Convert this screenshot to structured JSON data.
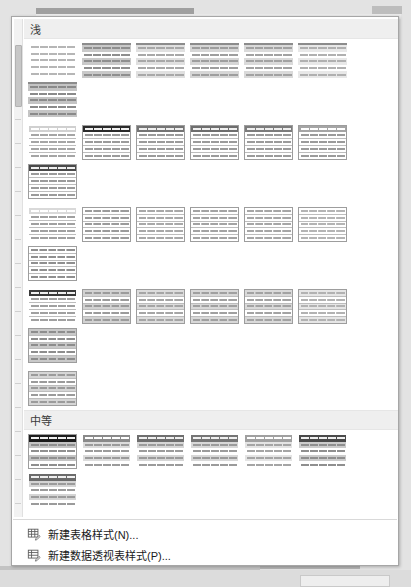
{
  "window": {
    "title": "表格样式库",
    "type": "table-styles-gallery-dropdown"
  },
  "scrollbar": {
    "orientation": "vertical",
    "position": "top"
  },
  "sections": [
    {
      "id": "light",
      "label": "浅",
      "rows": [
        {
          "thumbs": [
            {
              "name": "none-style",
              "border": "none",
              "header": null,
              "banding": "none",
              "tone": "#b6b6b6",
              "cols": false
            },
            {
              "name": "table-style-light-1",
              "border": "topline",
              "header": null,
              "banding": "rows",
              "tone": "#8f8f8f",
              "bandFill": "#c9c9c9",
              "cols": false
            },
            {
              "name": "table-style-light-2",
              "border": "topline",
              "header": null,
              "banding": "rows",
              "tone": "#a8a8a8",
              "bandFill": "#e0e0e0",
              "cols": false
            },
            {
              "name": "table-style-light-3",
              "border": "topline",
              "header": null,
              "banding": "rows",
              "tone": "#9e9e9e",
              "bandFill": "#d6d6d6",
              "cols": false
            },
            {
              "name": "table-style-light-4",
              "border": "topline",
              "header": null,
              "banding": "rows",
              "tone": "#a2a2a2",
              "bandFill": "#dadada",
              "cols": false
            },
            {
              "name": "table-style-light-5",
              "border": "topline",
              "header": null,
              "banding": "rows",
              "tone": "#b0b0b0",
              "bandFill": "#e8e8e8",
              "cols": false
            },
            {
              "name": "table-style-light-6",
              "border": "topline",
              "header": null,
              "banding": "rows",
              "tone": "#8a8a8a",
              "bandFill": "#c4c4c4",
              "cols": false
            }
          ]
        },
        {
          "thumbs": [
            {
              "name": "table-style-light-7",
              "border": "none",
              "header": "#d0d0d0",
              "banding": "lines",
              "tone": "#a5a5a5",
              "cols": false
            },
            {
              "name": "table-style-light-8",
              "border": "bordered",
              "header": "#2b2b2b",
              "banding": "lines",
              "tone": "#9b9b9b",
              "cols": false
            },
            {
              "name": "table-style-light-9",
              "border": "bordered",
              "header": "#747474",
              "banding": "lines",
              "tone": "#9b9b9b",
              "cols": false
            },
            {
              "name": "table-style-light-10",
              "border": "bordered",
              "header": "#6e6e6e",
              "banding": "lines",
              "tone": "#9b9b9b",
              "cols": false
            },
            {
              "name": "table-style-light-11",
              "border": "bordered",
              "header": "#7c7c7c",
              "banding": "lines",
              "tone": "#9b9b9b",
              "cols": false
            },
            {
              "name": "table-style-light-12",
              "border": "bordered",
              "header": "#a5a5a5",
              "banding": "lines",
              "tone": "#9b9b9b",
              "cols": false
            },
            {
              "name": "table-style-light-13",
              "border": "bordered",
              "header": "#4a4a4a",
              "banding": "lines",
              "tone": "#9b9b9b",
              "cols": false
            }
          ]
        },
        {
          "thumbs": [
            {
              "name": "table-style-light-14",
              "border": "none",
              "header": "#d9d9d9",
              "banding": "lines",
              "tone": "#a0a0a0",
              "cols": false
            },
            {
              "name": "table-style-light-15",
              "border": "bordered",
              "header": null,
              "banding": "grid",
              "tone": "#9b9b9b",
              "cols": true
            },
            {
              "name": "table-style-light-16",
              "border": "bordered",
              "header": null,
              "banding": "grid",
              "tone": "#a8a8a8",
              "cols": true
            },
            {
              "name": "table-style-light-17",
              "border": "bordered",
              "header": null,
              "banding": "grid",
              "tone": "#a3a3a3",
              "cols": true
            },
            {
              "name": "table-style-light-18",
              "border": "bordered",
              "header": null,
              "banding": "grid",
              "tone": "#a6a6a6",
              "cols": true
            },
            {
              "name": "table-style-light-19",
              "border": "bordered",
              "header": null,
              "banding": "grid",
              "tone": "#b4b4b4",
              "cols": true
            },
            {
              "name": "table-style-light-20",
              "border": "bordered",
              "header": null,
              "banding": "grid",
              "tone": "#8f8f8f",
              "cols": true
            }
          ]
        },
        {
          "thumbs": [
            {
              "name": "table-style-light-21",
              "border": "none",
              "header": "#3a3a3a",
              "banding": "lines",
              "tone": "#a0a0a0",
              "cols": false
            },
            {
              "name": "table-style-light-22",
              "border": "bordered",
              "header": null,
              "banding": "grid-band",
              "tone": "#9b9b9b",
              "bandFill": "#d2d2d2",
              "cols": true
            },
            {
              "name": "table-style-light-23",
              "border": "bordered",
              "header": null,
              "banding": "grid-band",
              "tone": "#a5a5a5",
              "bandFill": "#dcdcdc",
              "cols": true
            },
            {
              "name": "table-style-light-24",
              "border": "bordered",
              "header": null,
              "banding": "grid-band",
              "tone": "#a0a0a0",
              "bandFill": "#d8d8d8",
              "cols": true
            },
            {
              "name": "table-style-light-25",
              "border": "bordered",
              "header": null,
              "banding": "grid-band",
              "tone": "#a3a3a3",
              "bandFill": "#dadada",
              "cols": true
            },
            {
              "name": "table-style-light-26",
              "border": "bordered",
              "header": null,
              "banding": "grid-band",
              "tone": "#b2b2b2",
              "bandFill": "#e6e6e6",
              "cols": true
            },
            {
              "name": "table-style-light-27",
              "border": "bordered",
              "header": null,
              "banding": "grid-band",
              "tone": "#8d8d8d",
              "bandFill": "#c9c9c9",
              "cols": true
            }
          ]
        },
        {
          "thumbs": [
            {
              "name": "table-style-light-28",
              "border": "bordered",
              "header": null,
              "banding": "grid-band",
              "tone": "#9b9b9b",
              "bandFill": "#d6d6d6",
              "cols": true
            }
          ]
        }
      ]
    },
    {
      "id": "medium",
      "label": "中等",
      "rows": [
        {
          "thumbs": [
            {
              "name": "table-style-medium-1",
              "border": "bordered",
              "header": "#1c1c1c",
              "banding": "rows",
              "tone": "#8f8f8f",
              "bandFill": "#c4c4c4",
              "cols": false
            },
            {
              "name": "table-style-medium-2",
              "border": "none",
              "header": "#8a8a8a",
              "banding": "rows",
              "tone": "#9b9b9b",
              "bandFill": "#dcdcdc",
              "cols": false
            },
            {
              "name": "table-style-medium-3",
              "border": "none",
              "header": "#6e6e6e",
              "banding": "rows",
              "tone": "#9b9b9b",
              "bandFill": "#d6d6d6",
              "cols": false
            },
            {
              "name": "table-style-medium-4",
              "border": "none",
              "header": "#757575",
              "banding": "rows",
              "tone": "#9b9b9b",
              "bandFill": "#d8d8d8",
              "cols": false
            },
            {
              "name": "table-style-medium-5",
              "border": "none",
              "header": "#a0a0a0",
              "banding": "rows",
              "tone": "#a5a5a5",
              "bandFill": "#e4e4e4",
              "cols": false
            },
            {
              "name": "table-style-medium-6",
              "border": "none",
              "header": "#4a4a4a",
              "banding": "rows",
              "tone": "#8f8f8f",
              "bandFill": "#cccccc",
              "cols": false
            },
            {
              "name": "table-style-medium-7",
              "border": "none",
              "header": "#6b6b6b",
              "banding": "rows",
              "tone": "#9b9b9b",
              "bandFill": "#d4d4d4",
              "cols": false
            }
          ]
        },
        {
          "thumbs": [
            {
              "name": "table-style-medium-8",
              "border": "none",
              "header": "#2b2b2b",
              "banding": "cols-band",
              "tone": "#8f8f8f",
              "bandFill": "#bdbdbd",
              "cols": true
            },
            {
              "name": "table-style-medium-9",
              "border": "none",
              "header": "#8f8f8f",
              "banding": "cols-band",
              "tone": "#9b9b9b",
              "bandFill": "#d8d8d8",
              "cols": true
            },
            {
              "name": "table-style-medium-10",
              "border": "none",
              "header": "#7a7a7a",
              "banding": "cols-band",
              "tone": "#9b9b9b",
              "bandFill": "#d4d4d4",
              "cols": true
            },
            {
              "name": "table-style-medium-11",
              "border": "none",
              "header": "#808080",
              "banding": "cols-band",
              "tone": "#9b9b9b",
              "bandFill": "#d6d6d6",
              "cols": true
            },
            {
              "name": "table-style-medium-12",
              "border": "none",
              "header": "#aeaeae",
              "banding": "cols-band",
              "tone": "#a8a8a8",
              "bandFill": "#e6e6e6",
              "cols": true
            },
            {
              "name": "table-style-medium-13",
              "border": "none",
              "header": "#4f4f4f",
              "banding": "cols-band",
              "tone": "#8f8f8f",
              "bandFill": "#c9c9c9",
              "cols": true
            },
            {
              "name": "table-style-medium-14",
              "border": "none",
              "header": "#6e6e6e",
              "banding": "cols-band",
              "tone": "#9b9b9b",
              "bandFill": "#d2d2d2",
              "cols": true
            }
          ]
        },
        {
          "thumbs": [
            {
              "name": "table-style-medium-15",
              "border": "bordered",
              "header": "#2b2b2b",
              "banding": "grid-band",
              "tone": "#8f8f8f",
              "bandFill": "#c4c4c4",
              "cols": true
            },
            {
              "name": "table-style-medium-16",
              "border": "bordered",
              "header": "#8a8a8a",
              "banding": "grid-band",
              "tone": "#9b9b9b",
              "bandFill": "#dadada",
              "cols": true
            },
            {
              "name": "table-style-medium-17",
              "border": "bordered",
              "header": "#787878",
              "banding": "grid-band",
              "tone": "#9b9b9b",
              "bandFill": "#d6d6d6",
              "cols": true
            },
            {
              "name": "table-style-medium-18",
              "border": "bordered",
              "header": "#7e7e7e",
              "banding": "grid-band",
              "tone": "#9b9b9b",
              "bandFill": "#d8d8d8",
              "cols": true
            },
            {
              "name": "table-style-medium-19",
              "border": "bordered",
              "header": "#ababab",
              "banding": "grid-band",
              "tone": "#a8a8a8",
              "bandFill": "#e6e6e6",
              "cols": true
            },
            {
              "name": "table-style-medium-20",
              "border": "bordered",
              "header": "#4f4f4f",
              "banding": "grid-band",
              "tone": "#8f8f8f",
              "bandFill": "#cccccc",
              "cols": true
            },
            {
              "name": "table-style-medium-21",
              "border": "bordered",
              "header": "#6e6e6e",
              "banding": "grid-band",
              "tone": "#9b9b9b",
              "bandFill": "#d2d2d2",
              "cols": true
            }
          ]
        },
        {
          "thumbs": [
            {
              "name": "table-style-medium-22",
              "border": "bordered",
              "header": "#1f1f1f",
              "banding": "grid-band",
              "tone": "#8f8f8f",
              "bandFill": "#bdbdbd",
              "cols": true
            },
            {
              "name": "table-style-medium-23",
              "border": "bordered",
              "header": "#8f8f8f",
              "banding": "grid-band",
              "tone": "#9b9b9b",
              "bandFill": "#d8d8d8",
              "cols": true
            },
            {
              "name": "table-style-medium-24",
              "border": "bordered",
              "header": "#7a7a7a",
              "banding": "grid-band",
              "tone": "#9b9b9b",
              "bandFill": "#d4d4d4",
              "cols": true
            },
            {
              "name": "table-style-medium-25",
              "border": "bordered",
              "header": "#808080",
              "banding": "grid-band",
              "tone": "#9b9b9b",
              "bandFill": "#d6d6d6",
              "cols": true
            },
            {
              "name": "table-style-medium-26",
              "border": "bordered",
              "header": "#aeaeae",
              "banding": "grid-band",
              "tone": "#a8a8a8",
              "bandFill": "#e4e4e4",
              "cols": true
            },
            {
              "name": "table-style-medium-27",
              "border": "bordered",
              "header": "#4a4a4a",
              "banding": "grid-band",
              "tone": "#8f8f8f",
              "bandFill": "#c9c9c9",
              "cols": true
            },
            {
              "name": "table-style-medium-28",
              "border": "bordered",
              "header": "#6b6b6b",
              "banding": "grid-band",
              "tone": "#9b9b9b",
              "bandFill": "#d2d2d2",
              "cols": true
            }
          ]
        }
      ]
    },
    {
      "id": "dark",
      "label": "深",
      "rows": [
        {
          "thumbs": [
            {
              "name": "table-style-dark-1",
              "border": "none",
              "header": "#3f3f3f",
              "banding": "dark-rows",
              "tone": "#e8e8e8",
              "bandFill": "#5e5e5e",
              "bandFill2": "#707070",
              "cols": false
            },
            {
              "name": "table-style-dark-2",
              "border": "none",
              "header": "#4a4a4a",
              "banding": "dark-rows",
              "tone": "#ececec",
              "bandFill": "#6b6b6b",
              "bandFill2": "#7c7c7c",
              "cols": false
            },
            {
              "name": "table-style-dark-3",
              "border": "none",
              "header": "#1f1f1f",
              "banding": "dark-rows",
              "tone": "#e0e0e0",
              "bandFill": "#565656",
              "bandFill2": "#686868",
              "cols": false
            },
            {
              "name": "table-style-dark-4",
              "border": "none",
              "header": "#2b2b2b",
              "banding": "dark-rows",
              "tone": "#e4e4e4",
              "bandFill": "#606060",
              "bandFill2": "#727272",
              "cols": false
            },
            {
              "name": "table-style-dark-5",
              "border": "none",
              "header": "#8a8a8a",
              "banding": "dark-rows",
              "tone": "#f2f2f2",
              "bandFill": "#a0a0a0",
              "bandFill2": "#b0b0b0",
              "cols": false
            },
            {
              "name": "table-style-dark-6",
              "border": "none",
              "header": "#3a3a3a",
              "banding": "dark-rows",
              "tone": "#e8e8e8",
              "bandFill": "#585858",
              "bandFill2": "#6a6a6a",
              "cols": false
            },
            {
              "name": "table-style-dark-7",
              "border": "none",
              "header": "#4f4f4f",
              "banding": "dark-rows",
              "tone": "#ececec",
              "bandFill": "#6e6e6e",
              "bandFill2": "#808080",
              "cols": false
            }
          ]
        },
        {
          "thumbs": [
            {
              "name": "table-style-dark-8",
              "border": "none",
              "header": "#1f1f1f",
              "banding": "lines",
              "tone": "#8f8f8f",
              "cols": false
            },
            {
              "name": "table-style-dark-9",
              "border": "none",
              "header": "#b4b4b4",
              "banding": "lines",
              "tone": "#9b9b9b",
              "cols": false
            },
            {
              "name": "table-style-dark-10",
              "border": "none",
              "header": "#cccccc",
              "banding": "lines",
              "tone": "#a5a5a5",
              "cols": false
            },
            {
              "name": "table-style-dark-11",
              "border": "none",
              "header": "#6e6e6e",
              "banding": "lines",
              "tone": "#9b9b9b",
              "cols": false
            }
          ]
        }
      ]
    }
  ],
  "commands": [
    {
      "name": "new-table-style",
      "icon": "new-table-icon",
      "label": "新建表格样式(N)..."
    },
    {
      "name": "new-pivot-table-style",
      "icon": "new-pivot-table-icon",
      "label": "新建数据透视表样式(P)..."
    }
  ]
}
